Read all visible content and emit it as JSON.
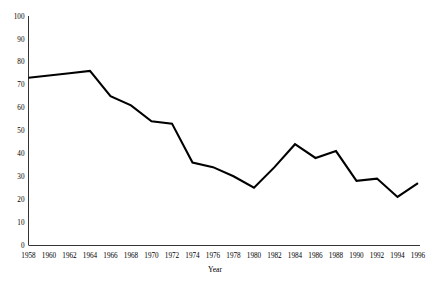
{
  "chart_data": {
    "type": "line",
    "title": "",
    "xlabel": "Year",
    "ylabel": "",
    "x": [
      1958,
      1960,
      1962,
      1964,
      1966,
      1968,
      1970,
      1972,
      1974,
      1976,
      1978,
      1980,
      1982,
      1984,
      1986,
      1988,
      1990,
      1992,
      1994,
      1996
    ],
    "values": [
      73,
      74,
      75,
      76,
      65,
      61,
      54,
      53,
      36,
      34,
      30,
      25,
      34,
      44,
      38,
      41,
      28,
      29,
      21,
      27
    ],
    "series": [
      {
        "name": "series-1",
        "values": [
          73,
          74,
          75,
          76,
          65,
          61,
          54,
          53,
          36,
          34,
          30,
          25,
          34,
          44,
          38,
          41,
          28,
          29,
          21,
          27
        ]
      }
    ],
    "xtick_labels": [
      "1958",
      "1960",
      "1962",
      "1964",
      "1966",
      "1968",
      "1970",
      "1972",
      "1974",
      "1976",
      "1978",
      "1980",
      "1982",
      "1984",
      "1986",
      "1988",
      "1990",
      "1992",
      "1994",
      "1996"
    ],
    "ytick_labels": [
      "0",
      "10",
      "20",
      "30",
      "40",
      "50",
      "60",
      "70",
      "80",
      "90",
      "100"
    ],
    "ytick_values": [
      0,
      10,
      20,
      30,
      40,
      50,
      60,
      70,
      80,
      90,
      100
    ],
    "xlim": [
      1958,
      1996
    ],
    "ylim": [
      0,
      100
    ],
    "grid": false,
    "legend": "none",
    "line_color": "#000000",
    "axis_color": "#000000",
    "background_color": "#ffffff"
  },
  "clipped_header": {
    "text": "",
    "note": "faint cut-off text fragment at very top edge"
  },
  "axis_titles": {
    "x": "Year"
  }
}
